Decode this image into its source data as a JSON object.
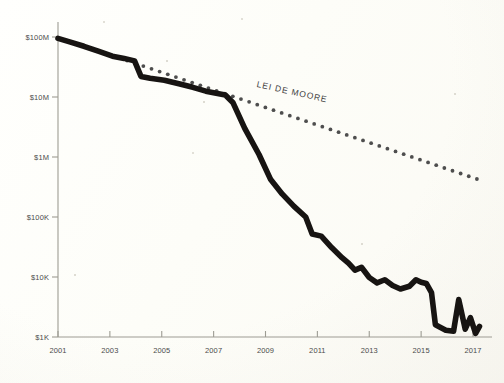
{
  "figure": {
    "background_color": "#fefefa",
    "ink_color": "#171412",
    "axis_color": "#9d9c93",
    "label_color": "#4b4b4b"
  },
  "chart_data": {
    "type": "line",
    "title": "",
    "subtitle": "",
    "xlabel": "",
    "ylabel": "",
    "xlim": [
      2001,
      2017.3
    ],
    "ylim": [
      1000,
      100000000
    ],
    "yscale": "log",
    "xscale": "linear",
    "grid": false,
    "legend_position": "inline-annotation",
    "x_tick_labels": [
      "2001",
      "2003",
      "2005",
      "2007",
      "2009",
      "2011",
      "2013",
      "2015",
      "2017"
    ],
    "x_ticks": [
      2001,
      2003,
      2005,
      2007,
      2009,
      2011,
      2013,
      2015,
      2017
    ],
    "y_tick_labels": [
      "$100M",
      "$10M",
      "$1M",
      "$100K",
      "$10K",
      "$1K"
    ],
    "y_ticks": [
      100000000,
      10000000,
      1000000,
      100000,
      10000,
      1000
    ],
    "annotations": [
      {
        "text": "LEI DE MOORE",
        "x": 2008.9,
        "y": 5200000,
        "rotation": 12.5
      }
    ],
    "series": [
      {
        "name": "cost-curve",
        "style": "solid-thick",
        "color": "#171412",
        "points": [
          [
            2001.0,
            95000000
          ],
          [
            2001.45,
            83000000
          ],
          [
            2002.0,
            70000000
          ],
          [
            2002.55,
            58000000
          ],
          [
            2003.1,
            48000000
          ],
          [
            2003.55,
            44000000
          ],
          [
            2003.95,
            40000000
          ],
          [
            2004.2,
            22000000
          ],
          [
            2004.55,
            20500000
          ],
          [
            2005.1,
            19000000
          ],
          [
            2005.7,
            16500000
          ],
          [
            2006.2,
            14500000
          ],
          [
            2006.7,
            12500000
          ],
          [
            2007.1,
            11500000
          ],
          [
            2007.45,
            10800000
          ],
          [
            2007.75,
            8000000
          ],
          [
            2008.2,
            3000000
          ],
          [
            2008.75,
            1100000
          ],
          [
            2009.2,
            420000
          ],
          [
            2009.65,
            240000
          ],
          [
            2010.1,
            150000
          ],
          [
            2010.55,
            100000
          ],
          [
            2010.8,
            52000
          ],
          [
            2011.15,
            48000
          ],
          [
            2011.55,
            31000
          ],
          [
            2011.95,
            21000
          ],
          [
            2012.2,
            17000
          ],
          [
            2012.45,
            13000
          ],
          [
            2012.7,
            14500
          ],
          [
            2013.0,
            9800
          ],
          [
            2013.3,
            8000
          ],
          [
            2013.6,
            9000
          ],
          [
            2013.9,
            7200
          ],
          [
            2014.2,
            6300
          ],
          [
            2014.55,
            7000
          ],
          [
            2014.8,
            9000
          ],
          [
            2015.0,
            8200
          ],
          [
            2015.2,
            7800
          ],
          [
            2015.4,
            5500
          ],
          [
            2015.55,
            1600
          ],
          [
            2015.95,
            1300
          ],
          [
            2016.25,
            1250
          ],
          [
            2016.45,
            4200
          ],
          [
            2016.7,
            1350
          ],
          [
            2016.9,
            2100
          ],
          [
            2017.1,
            1150
          ],
          [
            2017.25,
            1500
          ]
        ]
      },
      {
        "name": "moores-law-trend",
        "style": "dotted",
        "color": "#4e4e4e",
        "points": [
          [
            2003.35,
            45000000
          ],
          [
            2017.15,
            430000
          ]
        ]
      }
    ]
  }
}
